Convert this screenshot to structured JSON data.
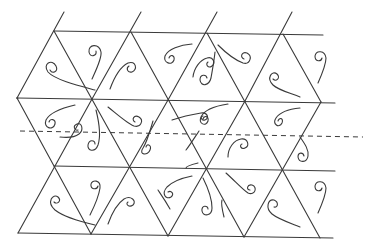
{
  "diagram": {
    "title": "",
    "colors": {
      "line": "#3a3a3a",
      "background": "#ffffff"
    },
    "horizontal_lines": [
      {
        "id": "row-a",
        "x1": 54,
        "y1": 31,
        "x2": 323,
        "y2": 35
      },
      {
        "id": "row-b",
        "x1": 17,
        "y1": 98,
        "x2": 335,
        "y2": 103
      },
      {
        "id": "row-c",
        "x1": 54,
        "y1": 166,
        "x2": 335,
        "y2": 171
      },
      {
        "id": "row-d",
        "x1": 18,
        "y1": 233,
        "x2": 333,
        "y2": 238
      }
    ],
    "rising_lines": [
      {
        "x1": 17,
        "y1": 98,
        "x2": 64,
        "y2": 12
      },
      {
        "x1": 92,
        "y1": 99,
        "x2": 141,
        "y2": 12
      },
      {
        "x1": 168,
        "y1": 100,
        "x2": 217,
        "y2": 12
      },
      {
        "x1": 245,
        "y1": 101,
        "x2": 292,
        "y2": 12
      },
      {
        "x1": 18,
        "y1": 233,
        "x2": 92,
        "y2": 99
      },
      {
        "x1": 91,
        "y1": 234,
        "x2": 168,
        "y2": 100
      },
      {
        "x1": 168,
        "y1": 236,
        "x2": 245,
        "y2": 101
      },
      {
        "x1": 244,
        "y1": 237,
        "x2": 321,
        "y2": 102
      }
    ],
    "falling_lines": [
      {
        "x1": 54,
        "y1": 31,
        "x2": 168,
        "y2": 236
      },
      {
        "x1": 131,
        "y1": 32,
        "x2": 244,
        "y2": 237
      },
      {
        "x1": 207,
        "y1": 33,
        "x2": 320,
        "y2": 238
      },
      {
        "x1": 283,
        "y1": 34,
        "x2": 321,
        "y2": 102
      },
      {
        "x1": 17,
        "y1": 98,
        "x2": 91,
        "y2": 234
      },
      {
        "x1": 17,
        "y1": 98,
        "x2": 18,
        "y2": 98
      }
    ],
    "dashed_axis": {
      "x1": 20,
      "y1": 131,
      "x2": 363,
      "y2": 137
    },
    "curls": [
      {
        "d": "M 95 90 C 80 86, 55 80, 48 72 C 42 64, 52 58, 56 66 C 59 72, 52 74, 50 70"
      },
      {
        "d": "M 92 79 C 97 68, 102 58, 101 52 C 99 43, 88 44, 89 52 C 90 58, 97 56, 96 51"
      },
      {
        "d": "M 110 89 C 114 78, 120 67, 128 63 C 136 60, 138 70, 132 72 C 127 73, 126 68, 129 66"
      },
      {
        "d": "M 192 44 C 180 45, 168 49, 165 56 C 163 63, 172 66, 174 60 C 175 55, 170 54, 169 58"
      },
      {
        "d": "M 75 105 C 62 108, 50 112, 46 120 C 43 128, 53 131, 55 124 C 56 119, 50 118, 49 122"
      },
      {
        "d": "M 96 110 C 99 122, 101 136, 98 145 C 95 153, 87 151, 88 145 C 89 139, 95 140, 95 144"
      },
      {
        "d": "M 108 107 C 118 115, 128 124, 134 126 C 141 128, 144 120, 139 117 C 134 114, 131 120, 135 122"
      },
      {
        "d": "M 193 77 C 194 68, 200 60, 207 58 C 213 56, 216 63, 212 66 C 208 69, 205 64, 208 62"
      },
      {
        "d": "M 218 45 C 226 53, 235 60, 243 63 C 250 65, 253 56, 247 53 C 241 51, 240 58, 244 59"
      },
      {
        "d": "M 215 52 C 214 62, 212 72, 211 78 C 209 86, 201 87, 200 80 C 200 74, 206 74, 207 78"
      },
      {
        "d": "M 300 97 C 290 93, 278 90, 273 85 C 266 78, 272 70, 277 74 C 281 78, 276 82, 273 79"
      },
      {
        "d": "M 318 83 C 322 74, 326 65, 326 58 C 325 50, 316 50, 315 56 C 315 62, 321 62, 322 58"
      },
      {
        "d": "M 228 104 C 215 106, 204 110, 201 117 C 198 124, 206 127, 208 121 C 209 116, 204 115, 203 119"
      },
      {
        "d": "M 300 108 C 290 109, 280 112, 276 118 C 272 124, 279 129, 282 123 C 284 118, 279 117, 278 121"
      },
      {
        "d": "M 300 137 C 305 144, 309 150, 308 156 C 307 163, 299 163, 298 157 C 298 152, 303 152, 304 156"
      },
      {
        "d": "M 153 121 C 150 131, 147 142, 143 148 C 138 155, 148 156, 150 150 C 152 145, 147 143, 146 147"
      },
      {
        "d": "M 172 120 C 184 116, 195 114, 201 113 C 207 112, 210 118, 205 120 C 201 121, 200 116, 203 116"
      },
      {
        "d": "M 228 157 C 228 148, 234 140, 241 139 C 248 138, 250 146, 245 148 C 241 150, 239 145, 242 144"
      },
      {
        "d": "M 60 137 C 68 138, 75 137, 79 134 C 84 130, 82 122, 77 124 C 72 126, 75 131, 78 130"
      },
      {
        "d": "M 199 131 C 195 137, 190 145, 186 150"
      },
      {
        "d": "M 226 173 C 235 181, 243 190, 248 193 C 255 196, 258 187, 252 185 C 247 184, 246 190, 250 190"
      },
      {
        "d": "M 198 163 C 190 165, 186 167, 186 168"
      },
      {
        "d": "M 203 178 C 208 188, 212 200, 212 208 C 212 216, 203 217, 202 211 C 201 205, 208 205, 208 209"
      },
      {
        "d": "M 95 225 C 82 222, 64 217, 55 210 C 46 202, 53 193, 58 197 C 62 201, 57 205, 54 202"
      },
      {
        "d": "M 90 215 C 95 205, 99 195, 100 188 C 101 180, 92 179, 91 184 C 90 190, 97 190, 98 186"
      },
      {
        "d": "M 108 224 C 112 213, 118 203, 124 199 C 131 195, 137 201, 133 205 C 129 208, 125 204, 128 202"
      },
      {
        "d": "M 192 176 C 182 178, 172 182, 167 187 C 161 194, 166 200, 171 197 C 175 194, 171 190, 168 192"
      },
      {
        "d": "M 300 227 C 290 223, 278 219, 272 214 C 265 208, 268 199, 274 200 C 279 202, 278 208, 274 207"
      },
      {
        "d": "M 318 213 C 322 204, 326 195, 326 188 C 325 180, 316 180, 315 186 C 315 192, 321 192, 322 188"
      },
      {
        "d": "M 170 209 C 165 200, 160 193, 158 190"
      },
      {
        "d": "M 224 217 C 222 209, 221 203, 222 200"
      }
    ]
  }
}
